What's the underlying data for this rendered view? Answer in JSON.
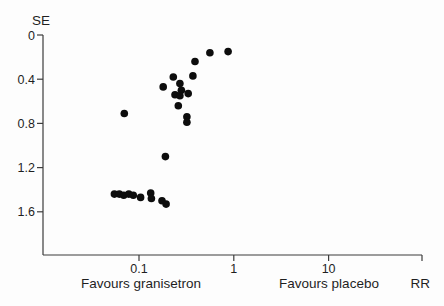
{
  "figure": {
    "background": "#fdfdfd",
    "text_color": "#1f1f1f",
    "axis_color": "#3c3c3c"
  },
  "chart_data": {
    "type": "scatter",
    "subtype": "funnel-plot",
    "title": "",
    "xlabel": "RR",
    "ylabel": "SE",
    "x_scale": "log",
    "x_range": [
      0.01,
      97
    ],
    "y_range": [
      0,
      2.0
    ],
    "y_inverted": true,
    "grid": false,
    "legend": false,
    "x_ticks": [
      {
        "value": 0.1,
        "label": "0.1"
      },
      {
        "value": 1,
        "label": "1"
      },
      {
        "value": 10,
        "label": "10"
      }
    ],
    "y_ticks": [
      {
        "value": 0,
        "label": "0"
      },
      {
        "value": 0.4,
        "label": "0.4"
      },
      {
        "value": 0.8,
        "label": "0.8"
      },
      {
        "value": 1.2,
        "label": "1.2"
      },
      {
        "value": 1.6,
        "label": "1.6"
      }
    ],
    "annotations": {
      "left": "Favours granisetron",
      "right": "Favours placebo"
    },
    "marker": {
      "shape": "circle",
      "color": "#0d0d0d",
      "radius_px": 3.8
    },
    "points": [
      {
        "rr": 0.39,
        "se": 0.24
      },
      {
        "rr": 0.56,
        "se": 0.16
      },
      {
        "rr": 0.87,
        "se": 0.15
      },
      {
        "rr": 0.37,
        "se": 0.37
      },
      {
        "rr": 0.23,
        "se": 0.38
      },
      {
        "rr": 0.18,
        "se": 0.47
      },
      {
        "rr": 0.27,
        "se": 0.44
      },
      {
        "rr": 0.28,
        "se": 0.5
      },
      {
        "rr": 0.24,
        "se": 0.54
      },
      {
        "rr": 0.27,
        "se": 0.55
      },
      {
        "rr": 0.33,
        "se": 0.53
      },
      {
        "rr": 0.26,
        "se": 0.64
      },
      {
        "rr": 0.32,
        "se": 0.74
      },
      {
        "rr": 0.32,
        "se": 0.79
      },
      {
        "rr": 0.07,
        "se": 0.71
      },
      {
        "rr": 0.19,
        "se": 1.1
      },
      {
        "rr": 0.055,
        "se": 1.44
      },
      {
        "rr": 0.062,
        "se": 1.44
      },
      {
        "rr": 0.069,
        "se": 1.45
      },
      {
        "rr": 0.078,
        "se": 1.44
      },
      {
        "rr": 0.087,
        "se": 1.45
      },
      {
        "rr": 0.104,
        "se": 1.47
      },
      {
        "rr": 0.133,
        "se": 1.43
      },
      {
        "rr": 0.135,
        "se": 1.48
      },
      {
        "rr": 0.175,
        "se": 1.5
      },
      {
        "rr": 0.193,
        "se": 1.53
      }
    ]
  }
}
